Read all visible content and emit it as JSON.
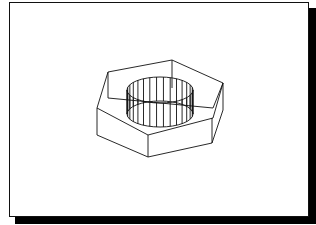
{
  "figure": {
    "colors": {
      "line": "#111111",
      "background": "#ffffff",
      "shadow": "#000000"
    },
    "hex_edges": [
      [
        108,
        72,
        172,
        60
      ],
      [
        172,
        60,
        223,
        83
      ],
      [
        172,
        60,
        172,
        88
      ],
      [
        108,
        72,
        97,
        108
      ],
      [
        108,
        72,
        108,
        98
      ],
      [
        108,
        98,
        213,
        108
      ],
      [
        97,
        108,
        148,
        135
      ],
      [
        148,
        135,
        213,
        118
      ],
      [
        213,
        118,
        223,
        83
      ],
      [
        213,
        108,
        223,
        83
      ],
      [
        97,
        108,
        97,
        135
      ],
      [
        97,
        135,
        148,
        157
      ],
      [
        148,
        135,
        148,
        157
      ],
      [
        148,
        157,
        212,
        143
      ],
      [
        212,
        118,
        212,
        143
      ],
      [
        212,
        143,
        223,
        110
      ],
      [
        223,
        83,
        223,
        110
      ]
    ],
    "cylinder": {
      "cx": 160,
      "top_cy": 90,
      "bottom_cy": 114,
      "rx": 33,
      "ry": 13,
      "ribs": 16
    }
  }
}
